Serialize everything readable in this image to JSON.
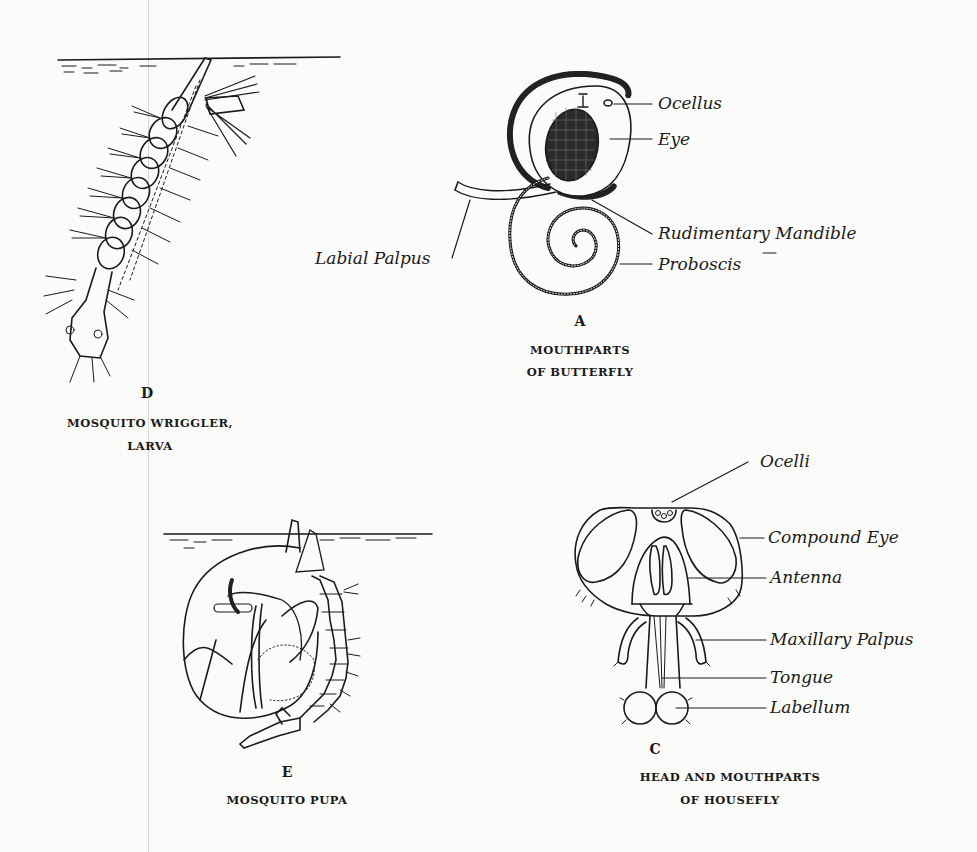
{
  "figures": {
    "A": {
      "letter": "A",
      "caption_line1": "MOUTHPARTS",
      "caption_line2": "OF BUTTERFLY",
      "labels": {
        "ocellus": "Ocellus",
        "eye": "Eye",
        "rudimentary_mandible": "Rudimentary Mandible",
        "labial_palpus": "Labial Palpus",
        "proboscis": "Proboscis"
      }
    },
    "C": {
      "letter": "C",
      "caption_line1": "HEAD AND MOUTHPARTS",
      "caption_line2": "OF HOUSEFLY",
      "labels": {
        "ocelli": "Ocelli",
        "compound_eye": "Compound Eye",
        "antenna": "Antenna",
        "maxillary_palpus": "Maxillary Palpus",
        "tongue": "Tongue",
        "labellum": "Labellum"
      }
    },
    "D": {
      "letter": "D",
      "caption_line1": "MOSQUITO WRIGGLER,",
      "caption_line2": "LARVA"
    },
    "E": {
      "letter": "E",
      "caption_line1": "MOSQUITO PUPA"
    }
  }
}
